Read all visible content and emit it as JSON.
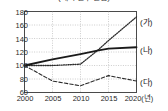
{
  "chart_data": {
    "type": "line",
    "title": "(제목 일부 잘림)",
    "xlabel": "년",
    "ylabel": "",
    "x": [
      2000,
      2005,
      2010,
      2013,
      2015,
      2020
    ],
    "xlim": [
      2000,
      2020
    ],
    "ylim": [
      60,
      180
    ],
    "grid": true,
    "legend_position": "right",
    "xticks": [
      "2000",
      "2005",
      "2010",
      "2015",
      "2020(년)"
    ],
    "xtick_values": [
      2000,
      2005,
      2010,
      2015,
      2020
    ],
    "yticks": [
      "60",
      "80",
      "100",
      "120",
      "140",
      "160",
      "180"
    ],
    "ytick_values": [
      60,
      80,
      100,
      120,
      140,
      160,
      180
    ],
    "series": [
      {
        "name": "(가)",
        "style": "dotted",
        "color": "#2b2b2b",
        "values": [
          100,
          100,
          102,
          122,
          137,
          172
        ]
      },
      {
        "name": "(나)",
        "style": "solid",
        "color": "#1a1a1a",
        "values": [
          100,
          109,
          117,
          122,
          125,
          127
        ]
      },
      {
        "name": "(다)",
        "style": "dashed",
        "color": "#2b2b2b",
        "values": [
          100,
          77,
          70,
          79,
          85,
          77
        ]
      }
    ]
  },
  "axis": {
    "x_unit_suffix": "(년)"
  }
}
